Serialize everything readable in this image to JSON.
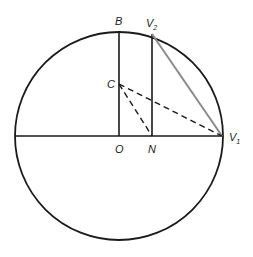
{
  "diagram": {
    "type": "geometry",
    "circle": {
      "cx": 119,
      "cy": 136,
      "r": 104,
      "stroke": "#1a1a1a"
    },
    "points": {
      "O": {
        "x": 119,
        "y": 136,
        "label": "O"
      },
      "N": {
        "x": 152,
        "y": 136,
        "label": "N"
      },
      "B": {
        "x": 119,
        "y": 31,
        "label": "B"
      },
      "C": {
        "x": 119,
        "y": 84,
        "label": "C"
      },
      "V1": {
        "x": 222,
        "y": 136,
        "label": "V",
        "sub": "1"
      },
      "V2": {
        "x": 152,
        "y": 34,
        "label": "V",
        "sub": "2"
      }
    },
    "segments": [
      {
        "from": "left-edge",
        "to": "V1",
        "style": "solid",
        "color": "#1a1a1a"
      },
      {
        "from": "O",
        "to": "B",
        "style": "solid",
        "color": "#1a1a1a"
      },
      {
        "from": "N",
        "to": "V2",
        "style": "solid",
        "color": "#1a1a1a"
      },
      {
        "from": "V2",
        "to": "V1",
        "style": "solid",
        "color": "#8a8a8a"
      },
      {
        "from": "C",
        "to": "V1",
        "style": "dashed",
        "color": "#1a1a1a"
      },
      {
        "from": "C",
        "to": "N",
        "style": "dashed",
        "color": "#1a1a1a"
      }
    ]
  }
}
